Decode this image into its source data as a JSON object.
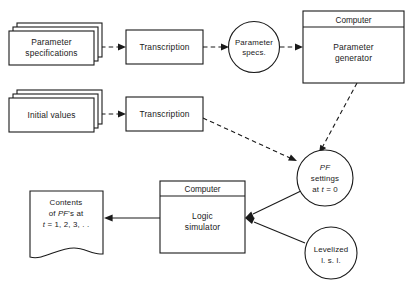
{
  "diagram": {
    "background_color": "#ffffff",
    "line_color": "#1a1a1a",
    "nodes": {
      "parameter_specifications": {
        "label_line1": "Parameter",
        "label_line2": "specifications",
        "shape": "stacked-document"
      },
      "transcription_top": {
        "label": "Transcription",
        "shape": "rectangle"
      },
      "parameter_specs_circle": {
        "label_line1": "Parameter",
        "label_line2": "specs.",
        "shape": "circle"
      },
      "computer_parameter_generator": {
        "header": "Computer",
        "label_line1": "Parameter",
        "label_line2": "generator",
        "shape": "computer-box"
      },
      "initial_values": {
        "label": "Initial values",
        "shape": "stacked-document"
      },
      "transcription_bottom": {
        "label": "Transcription",
        "shape": "rectangle"
      },
      "pf_settings_circle": {
        "label_line1": "PF",
        "label_line2": "settings",
        "label_line3_prefix": "at ",
        "label_line3_var": "t",
        "label_line3_suffix": " = 0",
        "shape": "circle"
      },
      "computer_logic_simulator": {
        "header": "Computer",
        "label_line1": "Logic",
        "label_line2": "simulator",
        "shape": "computer-box"
      },
      "levelized_circle": {
        "label_line1": "Levelized",
        "label_line2": "l. s. l.",
        "shape": "circle"
      },
      "contents_document": {
        "label_line1": "Contents",
        "label_line2_prefix": "of ",
        "label_line2_var": "PF",
        "label_line2_suffix": "'s at",
        "label_line3_var": "t",
        "label_line3_suffix": " = 1, 2, 3, . .",
        "shape": "torn-document"
      }
    },
    "edges": [
      {
        "name": "specs-to-transcription",
        "style": "dashed",
        "arrow": true
      },
      {
        "name": "transcription-to-specs-circle",
        "style": "dashed",
        "arrow": true
      },
      {
        "name": "specs-circle-to-generator",
        "style": "dashed",
        "arrow": true
      },
      {
        "name": "initial-values-to-transcription",
        "style": "dashed",
        "arrow": true
      },
      {
        "name": "generator-to-pf-settings",
        "style": "dashed",
        "arrow": true
      },
      {
        "name": "transcription-bottom-to-pf-settings",
        "style": "dashed",
        "arrow": true
      },
      {
        "name": "pf-settings-to-logic-simulator",
        "style": "solid",
        "arrow": true
      },
      {
        "name": "levelized-to-logic-simulator",
        "style": "solid",
        "arrow": true
      },
      {
        "name": "logic-simulator-to-contents",
        "style": "solid",
        "arrow": true
      }
    ]
  }
}
